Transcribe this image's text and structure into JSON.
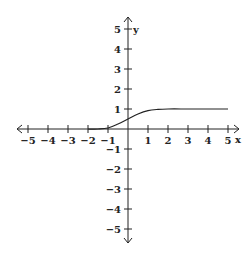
{
  "chart_data": {
    "type": "line",
    "title": "",
    "xlabel": "x",
    "ylabel": "y",
    "xlim": [
      -5,
      5
    ],
    "ylim": [
      -5,
      5
    ],
    "grid": false,
    "x_ticks": [
      -5,
      -4,
      -3,
      -2,
      -1,
      1,
      2,
      3,
      4,
      5
    ],
    "y_ticks": [
      5,
      4,
      3,
      2,
      1,
      -1,
      -2,
      -3,
      -4,
      -5
    ],
    "x_tick_labels": [
      "-5",
      "-4",
      "-3",
      "-2",
      "-1",
      "1",
      "2",
      "3",
      "4",
      "5"
    ],
    "y_tick_labels": [
      "5",
      "4",
      "3",
      "2",
      "1",
      "-1",
      "-2",
      "-3",
      "-4",
      "-5"
    ],
    "series": [
      {
        "name": "f(x)",
        "description": "Starts at (-2, 0), stays near 0 until about x=-1, rises smoothly through about (0, 0.5), levels off at y=1 near x=2, continues flat to (5, 1)",
        "points": [
          [
            -2,
            0
          ],
          [
            -1.5,
            0.0
          ],
          [
            -1,
            0.05
          ],
          [
            -0.5,
            0.25
          ],
          [
            0,
            0.5
          ],
          [
            0.5,
            0.75
          ],
          [
            1,
            0.92
          ],
          [
            1.5,
            0.98
          ],
          [
            2,
            1
          ],
          [
            3,
            1
          ],
          [
            4,
            1
          ],
          [
            5,
            1
          ]
        ]
      }
    ]
  },
  "labels": {
    "x_axis": "x",
    "y_axis": "y"
  },
  "colors": {
    "axis": "#222222",
    "curve": "#222222"
  }
}
